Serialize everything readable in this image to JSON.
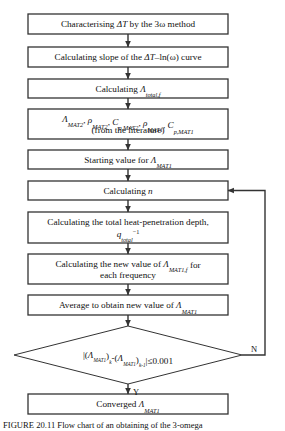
{
  "figure": {
    "type": "flowchart",
    "orientation": "top-to-bottom",
    "shape_fill": "#ffffff",
    "stroke_color": "#333333",
    "text_color": "#111111"
  },
  "nodes": [
    {
      "id": "n1",
      "shape": "process",
      "lines": [
        [
          {
            "t": "Characterising ",
            "s": "normal"
          },
          {
            "t": "ΔT",
            "s": "italic"
          },
          {
            "t": " by the 3ω method",
            "s": "normal"
          }
        ]
      ]
    },
    {
      "id": "n2",
      "shape": "process",
      "lines": [
        [
          {
            "t": "Calculating slope of the ",
            "s": "normal"
          },
          {
            "t": "ΔT",
            "s": "italic"
          },
          {
            "t": "–ln(ω) curve",
            "s": "normal"
          }
        ]
      ]
    },
    {
      "id": "n3",
      "shape": "process",
      "lines": [
        [
          {
            "t": "Calculating ",
            "s": "normal"
          },
          {
            "t": "Λ",
            "s": "italic"
          },
          {
            "t": "total,f",
            "s": "sub"
          }
        ]
      ]
    },
    {
      "id": "n4",
      "shape": "process",
      "lines": [
        [
          {
            "t": "Λ",
            "s": "italic"
          },
          {
            "t": "MAT2",
            "s": "sub"
          },
          {
            "t": ", ",
            "s": "normal"
          },
          {
            "t": "ρ",
            "s": "italic"
          },
          {
            "t": "MAT2",
            "s": "sub"
          },
          {
            "t": ", ",
            "s": "normal"
          },
          {
            "t": "C",
            "s": "italic"
          },
          {
            "t": "p,MAT2",
            "s": "sub"
          },
          {
            "t": ", ",
            "s": "normal"
          },
          {
            "t": "ρ",
            "s": "italic"
          },
          {
            "t": "MAT1",
            "s": "sub"
          },
          {
            "t": ", ",
            "s": "normal"
          },
          {
            "t": "C",
            "s": "italic"
          },
          {
            "t": "p,MAT1",
            "s": "sub"
          }
        ],
        [
          {
            "t": "(from the literature)",
            "s": "normal"
          }
        ]
      ]
    },
    {
      "id": "n5",
      "shape": "process",
      "lines": [
        [
          {
            "t": "Starting value for ",
            "s": "normal"
          },
          {
            "t": "Λ",
            "s": "italic"
          },
          {
            "t": "MAT1",
            "s": "sub"
          }
        ]
      ]
    },
    {
      "id": "n6",
      "shape": "process",
      "lines": [
        [
          {
            "t": "Calculating ",
            "s": "normal"
          },
          {
            "t": "n",
            "s": "italic"
          }
        ]
      ]
    },
    {
      "id": "n7",
      "shape": "process",
      "lines": [
        [
          {
            "t": "Calculating the total heat-penetration depth,",
            "s": "normal"
          }
        ],
        [
          {
            "t": "q",
            "s": "italic"
          },
          {
            "t": "total",
            "s": "sub"
          },
          {
            "t": "−1",
            "s": "sup"
          }
        ]
      ]
    },
    {
      "id": "n8",
      "shape": "process",
      "lines": [
        [
          {
            "t": "Calculating the new value of ",
            "s": "normal"
          },
          {
            "t": "Λ",
            "s": "italic"
          },
          {
            "t": "MAT1,f",
            "s": "sub"
          },
          {
            "t": " for",
            "s": "normal"
          }
        ],
        [
          {
            "t": "each frequency",
            "s": "normal"
          }
        ]
      ]
    },
    {
      "id": "n9",
      "shape": "process",
      "lines": [
        [
          {
            "t": "Average to obtain new value of ",
            "s": "normal"
          },
          {
            "t": "Λ",
            "s": "italic"
          },
          {
            "t": "MAT1",
            "s": "sub"
          }
        ]
      ]
    },
    {
      "id": "n10",
      "shape": "decision",
      "lines": [
        [
          {
            "t": "|(",
            "s": "normal"
          },
          {
            "t": "Λ",
            "s": "italic"
          },
          {
            "t": "MAT1",
            "s": "sub"
          },
          {
            "t": ")",
            "s": "normal"
          },
          {
            "t": "k",
            "s": "sub"
          },
          {
            "t": "-(",
            "s": "normal"
          },
          {
            "t": "Λ",
            "s": "italic"
          },
          {
            "t": "MAT1",
            "s": "sub"
          },
          {
            "t": ")",
            "s": "normal"
          },
          {
            "t": "k-1",
            "s": "sub"
          },
          {
            "t": "|≤0.001",
            "s": "normal"
          }
        ]
      ]
    },
    {
      "id": "n11",
      "shape": "process",
      "lines": [
        [
          {
            "t": "Converged ",
            "s": "normal"
          },
          {
            "t": "Λ",
            "s": "italic"
          },
          {
            "t": "MAT1",
            "s": "sub"
          }
        ]
      ]
    }
  ],
  "edge_labels": {
    "no": "N",
    "yes": "Y"
  },
  "caption": {
    "text": "FIGURE 20.11  Flow chart of an obtaining of the 3-omega"
  }
}
